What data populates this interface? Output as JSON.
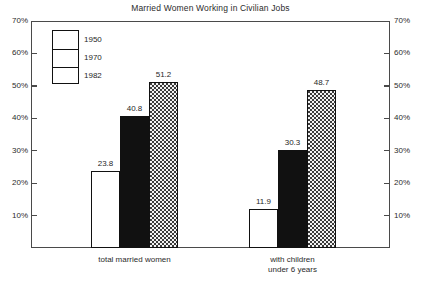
{
  "chart_data": {
    "type": "bar",
    "title": "Married Women Working in Civilian Jobs",
    "xlabel": "",
    "ylabel": "",
    "ylim": [
      0,
      70
    ],
    "grid": false,
    "legend_position": "top-left inside plot",
    "y_ticks": [
      "10%",
      "20%",
      "30%",
      "40%",
      "50%",
      "60%",
      "70%"
    ],
    "y_tick_values": [
      10,
      20,
      30,
      40,
      50,
      60,
      70
    ],
    "y_axis_left_labels": [
      "70%",
      "60%",
      "50%",
      "40%",
      "30%",
      "20%",
      "10%"
    ],
    "y_axis_right_labels": [
      "70%",
      "60%",
      "50%",
      "40%",
      "30%",
      "20%",
      "10%"
    ],
    "categories": [
      "total married women",
      "with children under 6 years"
    ],
    "category_label_lines": [
      [
        "total married women"
      ],
      [
        "with children",
        "under 6 years"
      ]
    ],
    "series": [
      {
        "name": "1950",
        "fill": "empty",
        "values": [
          23.8,
          11.9
        ]
      },
      {
        "name": "1970",
        "fill": "solid",
        "values": [
          40.8,
          30.3
        ]
      },
      {
        "name": "1982",
        "fill": "dotted",
        "values": [
          51.2,
          48.7
        ]
      }
    ],
    "data_labels": [
      "23.8",
      "40.8",
      "51.2",
      "11.9",
      "30.3",
      "48.7"
    ]
  },
  "legend": {
    "entries": [
      {
        "label": "1950",
        "fill": "empty"
      },
      {
        "label": "1970",
        "fill": "solid"
      },
      {
        "label": "1982",
        "fill": "dotted"
      }
    ]
  },
  "colors": {
    "frame": "#4a4a4a",
    "bar_outline": "#111111",
    "bar_solid": "#111111",
    "bar_empty": "#ffffff",
    "bar_dotted_base": "#f2f2f2",
    "text": "#1f1f1f",
    "background": "#ffffff"
  }
}
